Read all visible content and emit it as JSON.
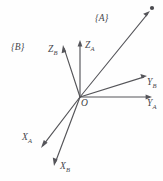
{
  "figure": {
    "type": "vector-diagram",
    "width": 163,
    "height": 181,
    "background_color": "#fefefe",
    "stroke_color": "#55555a",
    "label_color": "#47474c",
    "origin": {
      "label": "O",
      "x": 80,
      "y": 97
    },
    "frames": [
      {
        "id": "A",
        "label": "{A}",
        "x": 95,
        "y": 14
      },
      {
        "id": "B",
        "label": "{B}",
        "x": 11,
        "y": 43
      }
    ],
    "axes": [
      {
        "name": "X_A",
        "label": "X",
        "subscript": "A",
        "frame": "A",
        "from": {
          "x": 80,
          "y": 97
        },
        "to": {
          "x": 41,
          "y": 148
        },
        "label_pos": {
          "x": 22,
          "y": 133
        }
      },
      {
        "name": "Y_A",
        "label": "Y",
        "subscript": "A",
        "frame": "A",
        "from": {
          "x": 80,
          "y": 97
        },
        "to": {
          "x": 152,
          "y": 97
        },
        "label_pos": {
          "x": 147,
          "y": 99
        }
      },
      {
        "name": "Z_A",
        "label": "Z",
        "subscript": "A",
        "frame": "A",
        "from": {
          "x": 80,
          "y": 97
        },
        "to": {
          "x": 80,
          "y": 40
        },
        "label_pos": {
          "x": 85,
          "y": 41
        }
      },
      {
        "name": "X_B",
        "label": "X",
        "subscript": "B",
        "frame": "B",
        "from": {
          "x": 80,
          "y": 97
        },
        "to": {
          "x": 54,
          "y": 166
        },
        "label_pos": {
          "x": 60,
          "y": 162
        }
      },
      {
        "name": "Y_B",
        "label": "Y",
        "subscript": "B",
        "frame": "B",
        "from": {
          "x": 80,
          "y": 97
        },
        "to": {
          "x": 147,
          "y": 76
        },
        "label_pos": {
          "x": 147,
          "y": 78
        }
      },
      {
        "name": "Z_B",
        "label": "Z",
        "subscript": "B",
        "frame": "B",
        "from": {
          "x": 80,
          "y": 97
        },
        "to": {
          "x": 63,
          "y": 45
        },
        "label_pos": {
          "x": 48,
          "y": 45
        }
      }
    ],
    "point_vector": {
      "name": "point-vector",
      "from": {
        "x": 80,
        "y": 97
      },
      "to": {
        "x": 150,
        "y": 11
      },
      "point_marker": {
        "x": 152,
        "y": 8,
        "radius": 2.1
      }
    }
  }
}
